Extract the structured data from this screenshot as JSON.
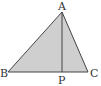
{
  "diagram": {
    "type": "triangle",
    "fill_color": "#cfcfcf",
    "stroke_color": "#444444",
    "vertices": {
      "A": {
        "label": "A",
        "x": 62,
        "y": 12
      },
      "B": {
        "label": "B",
        "x": 8,
        "y": 72
      },
      "C": {
        "label": "C",
        "x": 88,
        "y": 72
      },
      "P": {
        "label": "P",
        "x": 62,
        "y": 72
      }
    },
    "segments": [
      "AB",
      "BC",
      "CA",
      "AP"
    ]
  }
}
